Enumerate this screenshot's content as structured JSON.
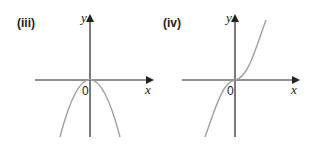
{
  "panels": [
    {
      "label": "(iii)",
      "x_axis_label": "x",
      "y_axis_label": "y",
      "origin_label": "0",
      "curve": "downward parabola with vertex at origin (y = -x^2)"
    },
    {
      "label": "(iv)",
      "x_axis_label": "x",
      "y_axis_label": "y",
      "origin_label": "0",
      "curve": "cubic through origin (y = x^3)"
    }
  ],
  "colors": {
    "axis": "#222222",
    "curve": "#a0a0a0"
  }
}
